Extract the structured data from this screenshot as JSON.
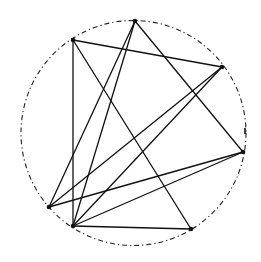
{
  "diagram": {
    "type": "inscribed-graph",
    "colors": {
      "background": "#ffffff",
      "stroke": "#111111",
      "circle": "#222222"
    },
    "circle": {
      "cx": 133.5,
      "cy": 133,
      "r": 112.5
    },
    "vertices": [
      {
        "id": "A",
        "x": 135,
        "y": 21
      },
      {
        "id": "B",
        "x": 73,
        "y": 40
      },
      {
        "id": "C",
        "x": 222,
        "y": 67
      },
      {
        "id": "D",
        "x": 243,
        "y": 152
      },
      {
        "id": "E",
        "x": 49,
        "y": 207
      },
      {
        "id": "F",
        "x": 73,
        "y": 226
      },
      {
        "id": "G",
        "x": 191,
        "y": 229
      }
    ],
    "edges": [
      [
        "B",
        "C"
      ],
      [
        "B",
        "F"
      ],
      [
        "B",
        "G"
      ],
      [
        "A",
        "E"
      ],
      [
        "A",
        "F"
      ],
      [
        "A",
        "D"
      ],
      [
        "C",
        "E"
      ],
      [
        "C",
        "F"
      ],
      [
        "D",
        "E"
      ],
      [
        "D",
        "F"
      ],
      [
        "F",
        "G"
      ]
    ],
    "marks": [
      {
        "type": "tick",
        "x": 245,
        "y": 131
      }
    ]
  }
}
